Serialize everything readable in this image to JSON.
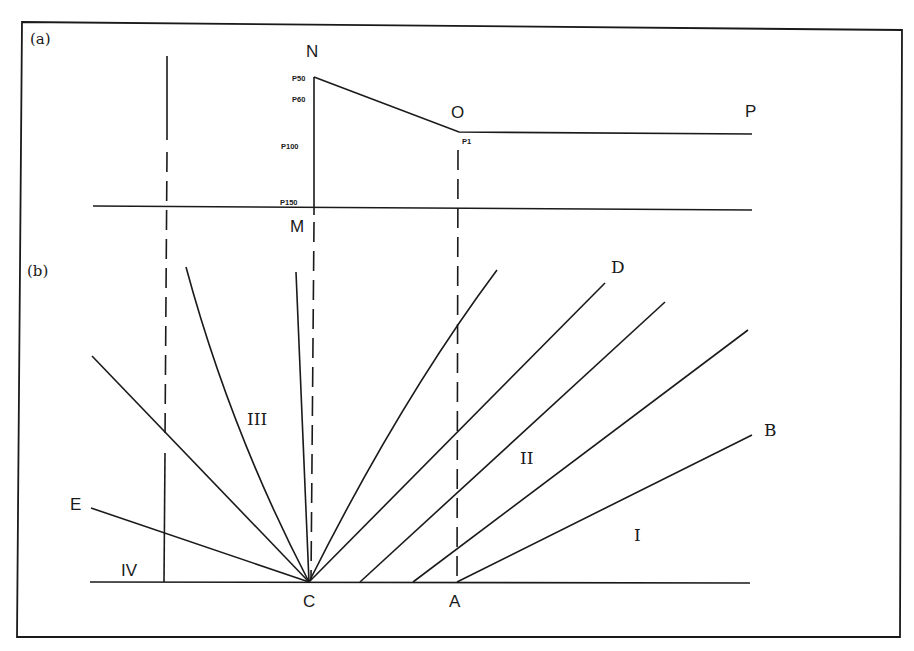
{
  "figure": {
    "panels": [
      {
        "id": "a",
        "label": "(a)"
      },
      {
        "id": "b",
        "label": "(b)"
      }
    ],
    "panel_a": {
      "points": {
        "N": "N",
        "O": "O",
        "P": "P",
        "M": "M"
      },
      "pressure_labels": {
        "p50": "P50",
        "p60": "P60",
        "p100": "P100",
        "p150": "P150",
        "p1": "P1"
      }
    },
    "panel_b": {
      "points": {
        "C": "C",
        "A": "A",
        "B": "B",
        "D": "D",
        "E": "E"
      },
      "regions": {
        "I": "I",
        "II": "II",
        "III": "III",
        "IV": "IV"
      }
    }
  }
}
